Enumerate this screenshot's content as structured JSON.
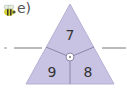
{
  "exercise": {
    "label": "e)",
    "icon": "bee-icon"
  },
  "triangle": {
    "top": "7",
    "bottom_left": "9",
    "bottom_right": "8",
    "fill": "#c9c3e3",
    "stroke": "#8a86a8"
  },
  "answer_lines": {
    "left": "",
    "right": ""
  }
}
